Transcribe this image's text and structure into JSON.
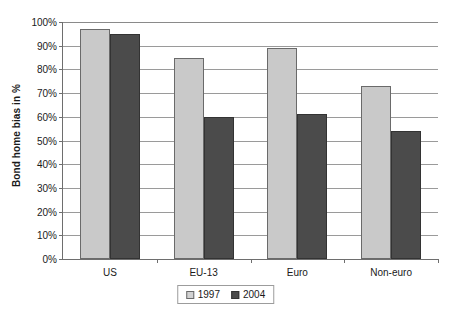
{
  "chart_data": {
    "type": "bar",
    "title": "",
    "subtitle": "",
    "xlabel": "",
    "ylabel": "Bond home bias in %",
    "categories": [
      "US",
      "EU-13",
      "Euro",
      "Non-euro"
    ],
    "series": [
      {
        "name": "1997",
        "color": "#c9c9c9",
        "values": [
          97,
          85,
          89,
          73
        ]
      },
      {
        "name": "2004",
        "color": "#4b4b4b",
        "values": [
          95,
          60,
          61,
          54
        ]
      }
    ],
    "ylim": [
      0,
      100
    ],
    "ytick_step": 10,
    "ytick_labels": [
      "0%",
      "10%",
      "20%",
      "30%",
      "40%",
      "50%",
      "60%",
      "70%",
      "80%",
      "90%",
      "100%"
    ],
    "ytick_values": [
      0,
      10,
      20,
      30,
      40,
      50,
      60,
      70,
      80,
      90,
      100
    ],
    "grid": true,
    "grid_axis": "y",
    "legend_position": "bottom",
    "legend_entries": [
      "1997",
      "2004"
    ]
  },
  "colors": {
    "series_1997": "#c9c9c9",
    "series_2004": "#4b4b4b",
    "axis": "#6e6e6e",
    "gridline": "#9a9a9a",
    "text": "#1a1a1a",
    "background": "#ffffff"
  }
}
